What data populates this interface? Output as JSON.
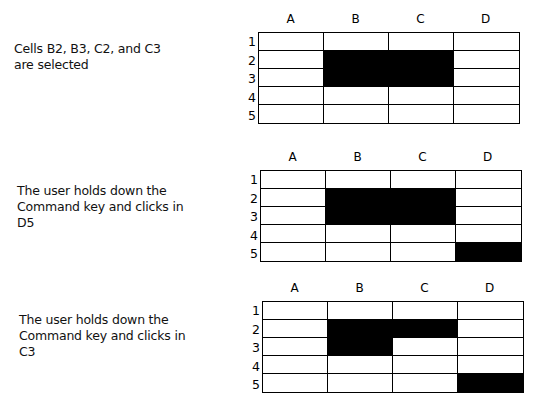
{
  "columns": [
    "A",
    "B",
    "C",
    "D"
  ],
  "rows": [
    "1",
    "2",
    "3",
    "4",
    "5"
  ],
  "colors": {
    "selected": "#000000",
    "unselected": "#ffffff",
    "grid": "#000000"
  },
  "panels": [
    {
      "caption": [
        "Cells B2, B3, C2, and C3",
        "are selected"
      ],
      "selected_cells": [
        "B2",
        "B3",
        "C2",
        "C3"
      ]
    },
    {
      "caption": [
        "The user holds down the",
        "Command key and clicks in",
        "D5"
      ],
      "selected_cells": [
        "B2",
        "B3",
        "C2",
        "C3",
        "D5"
      ]
    },
    {
      "caption": [
        "The user holds down the",
        "Command key and clicks in",
        "C3"
      ],
      "selected_cells": [
        "B2",
        "B3",
        "C2",
        "D5"
      ]
    }
  ]
}
